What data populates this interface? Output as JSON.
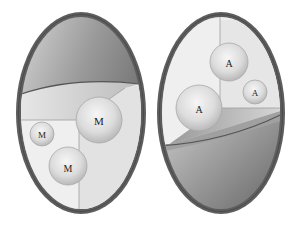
{
  "diagram": {
    "eggs": [
      {
        "id": "left",
        "cutaway": "bottom",
        "spheres": [
          {
            "label": "M",
            "cx": 99,
            "cy": 120,
            "r": 23
          },
          {
            "label": "M",
            "cx": 42,
            "cy": 134,
            "r": 12
          },
          {
            "label": "M",
            "cx": 68,
            "cy": 166,
            "r": 19
          }
        ]
      },
      {
        "id": "right",
        "cutaway": "top",
        "spheres": [
          {
            "label": "A",
            "cx": 229,
            "cy": 62,
            "r": 19
          },
          {
            "label": "A",
            "cx": 255,
            "cy": 92,
            "r": 12
          },
          {
            "label": "A",
            "cx": 199,
            "cy": 108,
            "r": 23
          }
        ]
      }
    ],
    "colors": {
      "shell_rim": "#5a5a5a",
      "shell_dark": "#6e6e6e",
      "shell_light": "#d8d8d8",
      "wall_light": "#f2f2f2",
      "wall_mid": "#e4e4e4",
      "sphere_light": "#f4f4f4",
      "sphere_dark": "#bdbdbd"
    }
  }
}
